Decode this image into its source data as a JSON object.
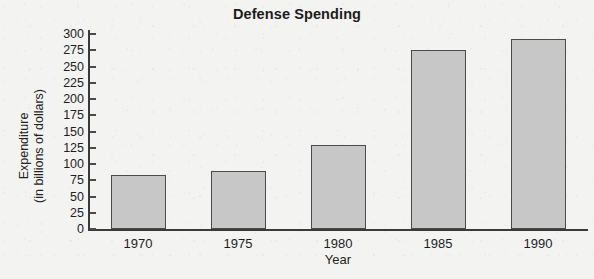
{
  "chart_data": {
    "type": "bar",
    "title": "Defense Spending",
    "xlabel": "Year",
    "ylabel": "Expenditure\n(in billions of dollars)",
    "categories": [
      "1970",
      "1975",
      "1980",
      "1985",
      "1990"
    ],
    "values": [
      83,
      90,
      130,
      275,
      293
    ],
    "ylim": [
      0,
      300
    ],
    "yticks": [
      0,
      25,
      50,
      75,
      100,
      125,
      150,
      175,
      200,
      225,
      250,
      275,
      300
    ],
    "ytick_labels": [
      "0",
      "25",
      "50",
      "75",
      "100",
      "125",
      "150",
      "175",
      "200",
      "225",
      "250",
      "275",
      "300"
    ],
    "grid": false,
    "legend": null,
    "bar_fill_color": "#c7c7c7",
    "bar_edge_color": "#4b4b4b",
    "axis_color": "#3a3a3a",
    "background_color": "#f3f3f2"
  }
}
